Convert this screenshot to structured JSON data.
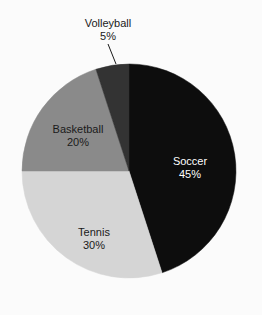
{
  "chart_data": {
    "type": "pie",
    "title": "",
    "subtitle": "",
    "xlabel": "",
    "ylabel": "",
    "grid": false,
    "legend": "none",
    "label_format": "name + percent",
    "start_angle_deg": 0,
    "direction": "clockwise",
    "categories": [
      "Soccer",
      "Tennis",
      "Basketball",
      "Volleyball"
    ],
    "values": [
      45,
      30,
      20,
      5
    ],
    "slices": [
      {
        "name": "Soccer",
        "value": 45,
        "percent_text": "45%",
        "color": "#0d0d0d",
        "text_color": "#ffffff",
        "label_placement": "inside",
        "label_x": 190,
        "label_y": 162,
        "start_angle_deg": 0,
        "end_angle_deg": 162
      },
      {
        "name": "Tennis",
        "value": 30,
        "percent_text": "30%",
        "color": "#d5d5d5",
        "text_color": "#1a1a1a",
        "label_placement": "inside",
        "label_x": 94,
        "label_y": 233,
        "start_angle_deg": 162,
        "end_angle_deg": 270
      },
      {
        "name": "Basketball",
        "value": 20,
        "percent_text": "20%",
        "color": "#8a8a8a",
        "text_color": "#1a1a1a",
        "label_placement": "inside",
        "label_x": 78,
        "label_y": 130,
        "start_angle_deg": 270,
        "end_angle_deg": 342
      },
      {
        "name": "Volleyball",
        "value": 5,
        "percent_text": "5%",
        "color": "#333333",
        "text_color": "#1a1a1a",
        "label_placement": "outside",
        "label_x": 108,
        "label_y": 24,
        "start_angle_deg": 342,
        "end_angle_deg": 360,
        "leader_line": {
          "x1": 108,
          "y1": 44,
          "x2": 116,
          "y2": 64
        }
      }
    ],
    "geometry": {
      "center_x": 129,
      "center_y": 171,
      "radius": 107
    },
    "background_color": "#fbfbfb"
  }
}
